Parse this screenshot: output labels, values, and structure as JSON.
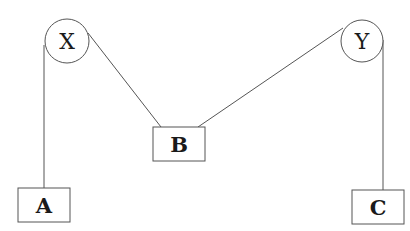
{
  "diagram": {
    "pulleys": [
      {
        "id": "X",
        "label": "X",
        "cx": 67,
        "cy": 41,
        "r": 22
      },
      {
        "id": "Y",
        "label": "Y",
        "cx": 362,
        "cy": 41,
        "r": 21
      }
    ],
    "blocks": [
      {
        "id": "A",
        "label": "A",
        "x": 18,
        "y": 188,
        "w": 52,
        "h": 34
      },
      {
        "id": "B",
        "label": "B",
        "x": 153,
        "y": 127,
        "w": 52,
        "h": 34
      },
      {
        "id": "C",
        "label": "C",
        "x": 352,
        "y": 190,
        "w": 52,
        "h": 34
      }
    ],
    "strings": [
      {
        "from": "X",
        "to": "A"
      },
      {
        "from": "X",
        "to": "B"
      },
      {
        "from": "Y",
        "to": "B"
      },
      {
        "from": "Y",
        "to": "C"
      }
    ],
    "colors": {
      "stroke": "#555555",
      "text": "#1a1a1a",
      "background": "#ffffff"
    }
  }
}
